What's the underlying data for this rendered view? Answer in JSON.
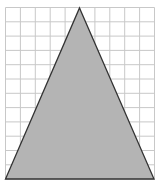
{
  "figure": {
    "grid": {
      "columns": 10,
      "rows": 12,
      "x0": 5.5,
      "y0": 7.5,
      "cell_w": 14.9,
      "cell_h": 14.3,
      "line_color": "#c8c8c8"
    },
    "triangle": {
      "apex": [
        79.5,
        8
      ],
      "base_left": [
        5.5,
        179
      ],
      "base_right": [
        154,
        179
      ],
      "fill": "#b4b4b4",
      "stroke": "#333333",
      "base_grid_units": 10,
      "height_grid_units": 12
    }
  }
}
